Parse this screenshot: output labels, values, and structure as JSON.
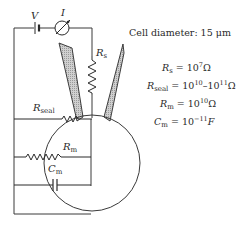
{
  "diagram": {
    "labels": {
      "voltage_source": "V",
      "current_meter": "I",
      "series_resistance": {
        "main": "R",
        "sub": "s"
      },
      "seal_resistance": {
        "main": "R",
        "sub": "seal"
      },
      "membrane_resistance": {
        "main": "R",
        "sub": "m"
      },
      "membrane_capacitance": {
        "main": "C",
        "sub": "m"
      }
    },
    "caption": "Cell diameter: 15 μm",
    "values": [
      {
        "symbol": "R",
        "sub": "s",
        "eq": " = 10",
        "exp": "7",
        "unit": "Ω"
      },
      {
        "symbol": "R",
        "sub": "seal",
        "eq": " = 10",
        "exp": "10",
        "mid": "–10",
        "exp2": "11",
        "unit": "Ω"
      },
      {
        "symbol": "R",
        "sub": "m",
        "eq": " = 10",
        "exp": "10",
        "unit": "Ω"
      },
      {
        "symbol": "C",
        "sub": "m",
        "eq": " = 10",
        "exp": "−11",
        "unit": "F"
      }
    ],
    "colors": {
      "line": "#3a3a3a",
      "pipette_fill": "#b8b8b8",
      "background": "#ffffff"
    }
  }
}
